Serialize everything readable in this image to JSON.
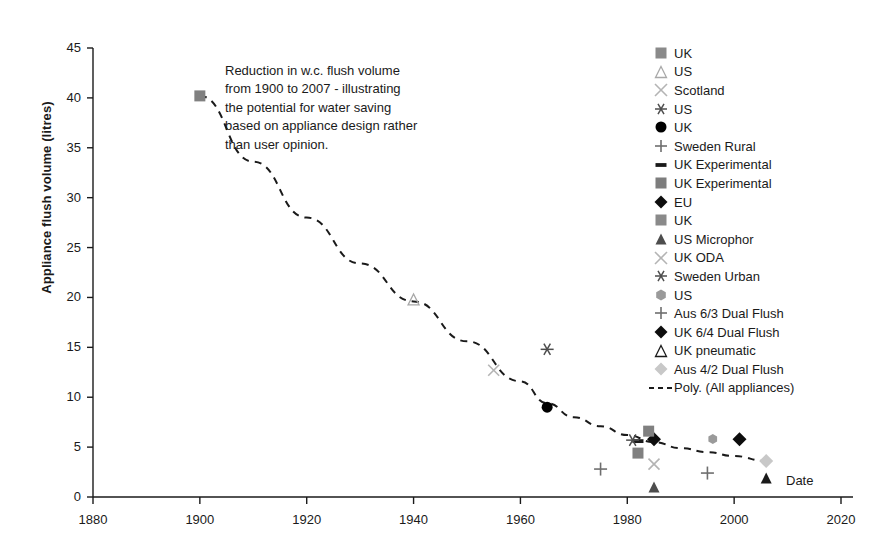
{
  "chart_data": {
    "type": "scatter",
    "title": "",
    "xlabel": "Date",
    "ylabel": "Appliance flush volume (litres)",
    "xlim": [
      1880,
      2020
    ],
    "ylim": [
      0,
      45
    ],
    "xticks": [
      "1880",
      "1900",
      "1920",
      "1940",
      "1960",
      "1980",
      "2000",
      "2020"
    ],
    "yticks": [
      "45",
      "40",
      "35",
      "30",
      "25",
      "20",
      "15",
      "10",
      "5",
      "0"
    ],
    "grid": false,
    "legend_position": "right",
    "annotation_lines": [
      "Reduction in w.c. flush volume",
      "from 1900 to 2007 - illustrating",
      "the potential for water saving",
      "based on appliance design rather",
      "than user opinion."
    ],
    "series": [
      {
        "name": "UK",
        "marker": "square",
        "color": "#808080",
        "size": 11,
        "x": 1900,
        "y": 40.2
      },
      {
        "name": "US",
        "marker": "triangle-up-open",
        "color": "#a8a8a8",
        "size": 11,
        "x": 1940,
        "y": 19.8
      },
      {
        "name": "Scotland",
        "marker": "x",
        "color": "#b4b4b4",
        "size": 11,
        "x": 1955,
        "y": 12.7
      },
      {
        "name": "US",
        "marker": "asterisk",
        "color": "#4d4d4d",
        "size": 13,
        "x": 1965,
        "y": 14.8
      },
      {
        "name": "UK",
        "marker": "circle",
        "color": "#000000",
        "size": 11,
        "x": 1965,
        "y": 9.0
      },
      {
        "name": "Sweden Rural",
        "marker": "plus",
        "color": "#6e6e6e",
        "size": 13,
        "x": 1975,
        "y": 2.8
      },
      {
        "name": "UK Experimental",
        "marker": "dash",
        "color": "#1a1a1a",
        "size": 11,
        "x": 1982,
        "y": 5.6
      },
      {
        "name": "UK Experimental",
        "marker": "square",
        "color": "#808080",
        "size": 11,
        "x": 1982,
        "y": 4.4
      },
      {
        "name": "EU",
        "marker": "diamond",
        "color": "#0d0d0d",
        "size": 12,
        "x": 1985,
        "y": 5.8
      },
      {
        "name": "UK",
        "marker": "square",
        "color": "#808080",
        "size": 11,
        "x": 1984,
        "y": 6.6
      },
      {
        "name": "US Microphor",
        "marker": "triangle-up",
        "color": "#4d4d4d",
        "size": 11,
        "x": 1985,
        "y": 1.0
      },
      {
        "name": "UK ODA",
        "marker": "x",
        "color": "#b4b4b4",
        "size": 11,
        "x": 1985,
        "y": 3.3
      },
      {
        "name": "Sweden Urban",
        "marker": "asterisk",
        "color": "#4d4d4d",
        "size": 13,
        "x": 1981,
        "y": 5.7
      },
      {
        "name": "US",
        "marker": "hexagon",
        "color": "#9a9a9a",
        "size": 10,
        "x": 1996,
        "y": 5.8
      },
      {
        "name": "Aus 6/3 Dual Flush",
        "marker": "plus",
        "color": "#6e6e6e",
        "size": 13,
        "x": 1995,
        "y": 2.4
      },
      {
        "name": "UK 6/4 Dual Flush",
        "marker": "diamond",
        "color": "#0d0d0d",
        "size": 12,
        "x": 2001,
        "y": 5.8
      },
      {
        "name": "UK pneumatic",
        "marker": "triangle-up",
        "color": "#1a1a1a",
        "size": 11,
        "x": 2006,
        "y": 1.9
      },
      {
        "name": "Aus 4/2 Dual Flush",
        "marker": "diamond",
        "color": "#c8c8c8",
        "size": 12,
        "x": 2006,
        "y": 3.6
      }
    ],
    "trendline": {
      "name": "Poly. (All appliances)",
      "style": "dashed",
      "color": "#1a1a1a",
      "points": [
        [
          1900,
          40.2
        ],
        [
          1910,
          33.6
        ],
        [
          1920,
          28.0
        ],
        [
          1930,
          23.4
        ],
        [
          1940,
          19.6
        ],
        [
          1950,
          15.6
        ],
        [
          1960,
          11.6
        ],
        [
          1965,
          9.4
        ],
        [
          1970,
          8.0
        ],
        [
          1975,
          7.1
        ],
        [
          1980,
          6.2
        ],
        [
          1985,
          5.5
        ],
        [
          1990,
          4.9
        ],
        [
          1995,
          4.5
        ],
        [
          2000,
          4.1
        ],
        [
          2006,
          3.6
        ]
      ]
    }
  },
  "legend": {
    "entries": [
      {
        "label": "UK",
        "marker": "square",
        "color": "#8a8a8a"
      },
      {
        "label": "US",
        "marker": "triangle-up-open",
        "color": "#a8a8a8"
      },
      {
        "label": "Scotland",
        "marker": "x",
        "color": "#b4b4b4"
      },
      {
        "label": "US",
        "marker": "asterisk",
        "color": "#4d4d4d"
      },
      {
        "label": "UK",
        "marker": "circle",
        "color": "#000000"
      },
      {
        "label": "Sweden Rural",
        "marker": "plus",
        "color": "#6e6e6e"
      },
      {
        "label": "UK Experimental",
        "marker": "dash",
        "color": "#1a1a1a"
      },
      {
        "label": "UK Experimental",
        "marker": "square",
        "color": "#7d7d7d"
      },
      {
        "label": "EU",
        "marker": "diamond",
        "color": "#0d0d0d"
      },
      {
        "label": "UK",
        "marker": "square",
        "color": "#8a8a8a"
      },
      {
        "label": "US Microphor",
        "marker": "triangle-up",
        "color": "#4d4d4d"
      },
      {
        "label": "UK ODA",
        "marker": "x",
        "color": "#b4b4b4"
      },
      {
        "label": "Sweden Urban",
        "marker": "asterisk",
        "color": "#4d4d4d"
      },
      {
        "label": "US",
        "marker": "hexagon",
        "color": "#9a9a9a"
      },
      {
        "label": "Aus 6/3 Dual Flush",
        "marker": "plus",
        "color": "#6e6e6e"
      },
      {
        "label": "UK 6/4 Dual Flush",
        "marker": "diamond",
        "color": "#0d0d0d"
      },
      {
        "label": "UK pneumatic",
        "marker": "triangle-up-open2",
        "color": "#1a1a1a"
      },
      {
        "label": "Aus 4/2 Dual Flush",
        "marker": "diamond",
        "color": "#c8c8c8"
      },
      {
        "label": "Poly. (All appliances)",
        "marker": "dashline",
        "color": "#1a1a1a"
      }
    ]
  },
  "axis": {
    "color": "#1a1a1a"
  }
}
